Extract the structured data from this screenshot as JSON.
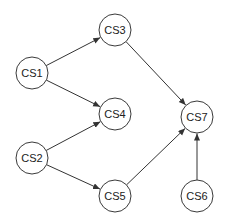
{
  "diagram": {
    "type": "directed-graph",
    "nodes": [
      {
        "id": "CS1",
        "label": "CS1",
        "x": 32,
        "y": 73
      },
      {
        "id": "CS2",
        "label": "CS2",
        "x": 32,
        "y": 158
      },
      {
        "id": "CS3",
        "label": "CS3",
        "x": 115,
        "y": 30
      },
      {
        "id": "CS4",
        "label": "CS4",
        "x": 115,
        "y": 114
      },
      {
        "id": "CS5",
        "label": "CS5",
        "x": 115,
        "y": 196
      },
      {
        "id": "CS6",
        "label": "CS6",
        "x": 197,
        "y": 196
      },
      {
        "id": "CS7",
        "label": "CS7",
        "x": 197,
        "y": 117
      }
    ],
    "edges": [
      {
        "from": "CS1",
        "to": "CS3"
      },
      {
        "from": "CS1",
        "to": "CS4"
      },
      {
        "from": "CS2",
        "to": "CS4"
      },
      {
        "from": "CS2",
        "to": "CS5"
      },
      {
        "from": "CS3",
        "to": "CS7"
      },
      {
        "from": "CS5",
        "to": "CS7"
      },
      {
        "from": "CS6",
        "to": "CS7"
      }
    ],
    "node_radius": 16,
    "colors": {
      "stroke": "#3a3a3a",
      "edge": "#333333",
      "text": "#222222",
      "background": "#ffffff"
    }
  }
}
